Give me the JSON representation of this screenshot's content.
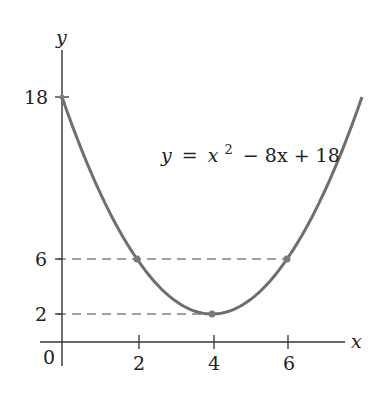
{
  "chart_data": {
    "type": "line",
    "title": "",
    "equation_label": "y = x² − 8x + 18",
    "equation_parts": {
      "lhs": "y",
      "eq": "=",
      "x": "x",
      "exp": "2",
      "rest": "− 8x + 18"
    },
    "xlabel": "x",
    "ylabel": "y",
    "origin_label": "0",
    "x_ticks": [
      2,
      4,
      6
    ],
    "y_ticks": [
      2,
      6,
      18
    ],
    "xlim": [
      0,
      8
    ],
    "ylim": [
      0,
      18
    ],
    "function": "x^2 - 8x + 18",
    "series": [
      {
        "name": "y = x^2 - 8x + 18",
        "x": [
          0,
          1,
          2,
          3,
          4,
          5,
          6,
          7,
          8
        ],
        "y": [
          18,
          11,
          6,
          3,
          2,
          3,
          6,
          11,
          18
        ]
      }
    ],
    "marked_points": [
      {
        "x": 0,
        "y": 18
      },
      {
        "x": 2,
        "y": 6
      },
      {
        "x": 4,
        "y": 2
      },
      {
        "x": 6,
        "y": 6
      }
    ],
    "dashed_guides": [
      {
        "y": 6,
        "from_x": 0,
        "to_x": 6
      },
      {
        "y": 2,
        "from_x": 0,
        "to_x": 4
      }
    ],
    "grid": false,
    "colors": {
      "curve": "#6e6e6e",
      "axis": "#333333",
      "points": "#7a7a7a"
    }
  }
}
